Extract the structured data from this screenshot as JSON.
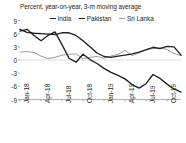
{
  "chart_data": {
    "type": "line",
    "title": "Percent, year-on-year, 3-m moving average",
    "xlabel": "",
    "ylabel": "",
    "ylim": [
      -9,
      9
    ],
    "yticks": [
      9,
      6,
      3,
      0,
      -3,
      -6,
      -9
    ],
    "ytick_labels": [
      "9",
      "6",
      "3",
      "0",
      "-3",
      "-6",
      "-9"
    ],
    "grid": false,
    "zero_line": true,
    "legend_position": "top",
    "x": [
      "Jan-18",
      "Feb-18",
      "Mar-18",
      "Apr-18",
      "May-18",
      "Jun-18",
      "Jul-18",
      "Aug-18",
      "Sep-18",
      "Oct-18",
      "Nov-18",
      "Dec-18",
      "Jan-19",
      "Feb-19",
      "Mar-19",
      "Apr-19",
      "May-19",
      "Jun-19",
      "Jul-19",
      "Aug-19",
      "Sep-19",
      "Oct-19",
      "Nov-19",
      "Dec-19"
    ],
    "xtick_labels": [
      "Jan-18",
      "Apr-18",
      "Jul-18",
      "Oct-18",
      "Jan-19",
      "Apr-19",
      "Jul-19",
      "Oct-19"
    ],
    "xtick_indices": [
      0,
      3,
      6,
      9,
      12,
      15,
      18,
      21
    ],
    "series": [
      {
        "name": "India",
        "color": "#231f20",
        "values": [
          7.0,
          6.3,
          6.1,
          6.0,
          5.9,
          5.8,
          6.2,
          6.2,
          5.6,
          4.4,
          3.0,
          1.6,
          0.8,
          0.6,
          0.9,
          1.1,
          1.4,
          1.8,
          2.3,
          2.9,
          2.6,
          3.1,
          3.0,
          1.1
        ]
      },
      {
        "name": "Pakistan",
        "color": "#231f20",
        "values": [
          6.6,
          7.0,
          5.6,
          4.4,
          5.6,
          6.4,
          3.5,
          0.4,
          -0.5,
          1.3,
          0.1,
          -0.8,
          -1.9,
          -2.8,
          -3.5,
          -4.3,
          -5.6,
          -6.4,
          -5.4,
          -3.3,
          -4.2,
          -5.5,
          -6.6,
          -7.3
        ]
      },
      {
        "name": "Sri Lanka",
        "color": "#9d9d9c",
        "values": [
          1.8,
          1.9,
          1.7,
          0.9,
          0.3,
          0.6,
          1.1,
          1.3,
          1.4,
          0.3,
          0.6,
          0.8,
          0.4,
          0.9,
          1.3,
          2.2,
          1.0,
          1.6,
          2.4,
          2.6,
          2.8,
          2.4,
          1.5,
          1.0
        ]
      }
    ]
  },
  "legend": {
    "items": [
      {
        "label": "India"
      },
      {
        "label": "Pakistan"
      },
      {
        "label": "Sri Lanka"
      }
    ]
  }
}
